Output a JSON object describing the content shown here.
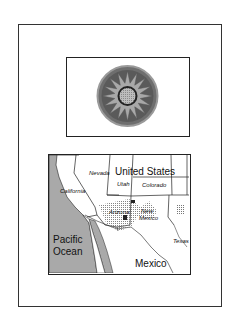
{
  "medallion": {
    "icon": "sun-star-medallion-icon",
    "colors": {
      "ring": "#6e6e6e",
      "ring_edge": "#9a9a9a",
      "star": "#a8a8a8",
      "center": "#bdbdbd",
      "dark": "#333333"
    }
  },
  "map": {
    "labels": {
      "country_us": "United States",
      "country_mx": "Mexico",
      "ocean_line1": "Pacific",
      "ocean_line2": "Ocean",
      "nevada": "Nevada",
      "utah": "Utah",
      "colorado": "Colorado",
      "california": "California",
      "arizona": "Arizona",
      "new_mexico_line1": "New",
      "new_mexico_line2": "Mexico",
      "texas": "Texas"
    },
    "colors": {
      "ocean": "#a9a9a9",
      "land": "#ffffff",
      "border": "#222222",
      "stipple": "#777777"
    }
  }
}
